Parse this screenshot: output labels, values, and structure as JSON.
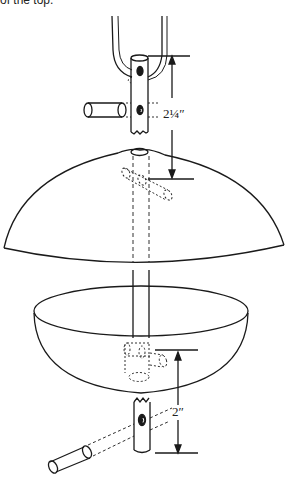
{
  "caption": "of the top.",
  "diagram": {
    "dimensions": [
      {
        "label": "2¼″",
        "description": "distance from top hole to roof pin"
      },
      {
        "label": "2″",
        "description": "distance from dish pin to tube bottom"
      }
    ],
    "parts": [
      "hanger wire",
      "upper tube",
      "upper pin",
      "roof dome",
      "dish bowl",
      "lower tube",
      "lower pin"
    ],
    "line_color": "#1a1a1a"
  }
}
